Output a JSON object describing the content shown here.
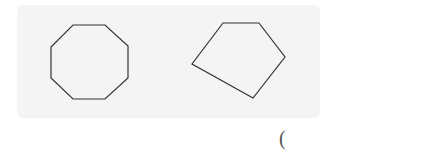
{
  "figure": {
    "shapes": [
      {
        "name": "octagon",
        "points": "73,25 105,25 128,46 128,78 105,99 73,99 51,78 51,47"
      },
      {
        "name": "pentagon",
        "points": "223,23 259,23 285,57 253,98 192,64"
      }
    ],
    "stroke_color": "#333333",
    "panel_color": "#f4f4f4"
  },
  "answer": {
    "open_paren": "("
  }
}
